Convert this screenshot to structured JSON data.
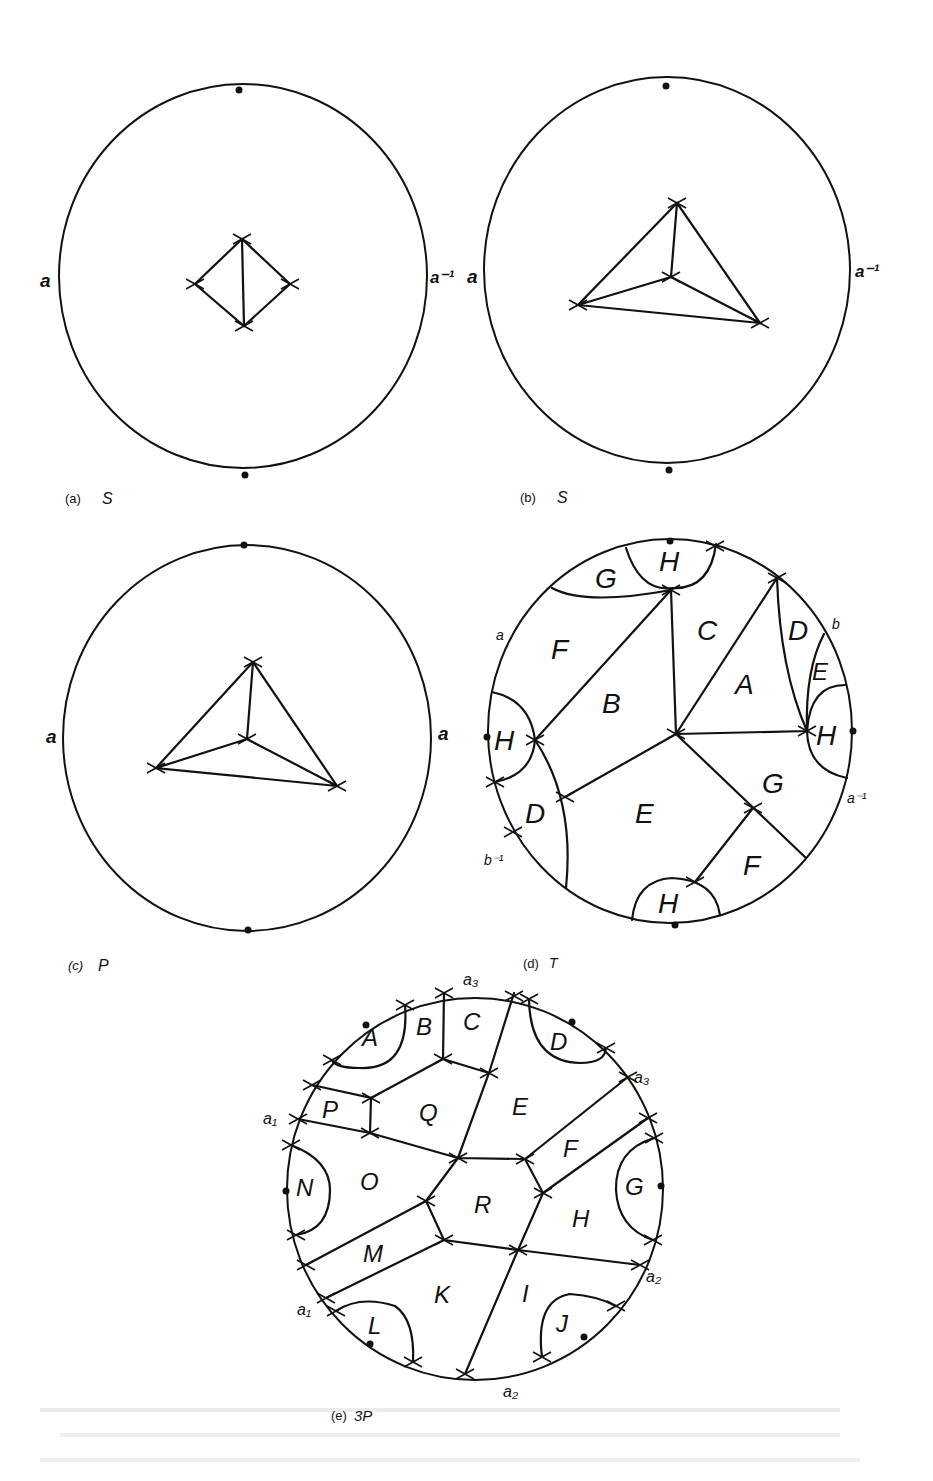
{
  "figure": {
    "panels": [
      {
        "id": "a",
        "caption_tag": "(a)",
        "caption_name": "S",
        "boundary_labels": {
          "left": "a",
          "right": "a⁻¹"
        },
        "description": "Disc with a four-vertex rhombus graph (diamond with vertical diagonal) in the centre"
      },
      {
        "id": "b",
        "caption_tag": "(b)",
        "caption_name": "S",
        "boundary_labels": {
          "left": "a",
          "right": "a⁻¹"
        },
        "description": "Disc with a triangle graph and one interior vertex joined to the three corners"
      },
      {
        "id": "c",
        "caption_tag": "(c)",
        "caption_name": "P",
        "boundary_labels": {
          "left": "a",
          "right": "a"
        },
        "description": "Disc with a triangle graph and one interior vertex joined to the three corners"
      },
      {
        "id": "d",
        "caption_tag": "(d)",
        "caption_name": "T",
        "boundary_labels": {
          "a": "a",
          "b": "b",
          "a_inv": "a⁻¹",
          "b_inv": "b⁻¹"
        },
        "regions": [
          "G",
          "H",
          "C",
          "D",
          "F",
          "E",
          "A",
          "B",
          "H",
          "H",
          "D",
          "E",
          "G",
          "F",
          "H"
        ]
      },
      {
        "id": "e",
        "caption_tag": "(e)",
        "caption_name": "3P",
        "boundary_labels": {
          "a3_top": "a₃",
          "a3_right": "a₃",
          "a1_left": "a₁",
          "a1_lower": "a₁",
          "a2_right": "a₂",
          "a2_bottom": "a₂"
        },
        "regions": [
          "A",
          "B",
          "C",
          "D",
          "P",
          "Q",
          "E",
          "F",
          "N",
          "O",
          "R",
          "G",
          "H",
          "M",
          "K",
          "I",
          "L",
          "J"
        ]
      }
    ]
  }
}
